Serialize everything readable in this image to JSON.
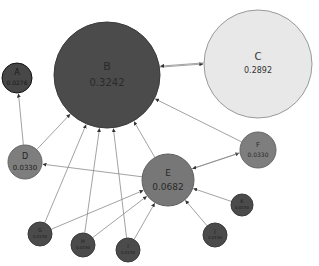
{
  "diagram": {
    "type": "directed-graph",
    "colors": {
      "edge": "#8a8a8a",
      "dark_node": "#4a4a4a",
      "mid_node": "#7e7e7e",
      "light_node": "#e6e6e6"
    },
    "nodes": [
      {
        "id": "A",
        "label": "A",
        "value": "0.0276",
        "cx": 17,
        "cy": 78,
        "r": 15,
        "fill": "#474747",
        "stroke": "#111111",
        "text": "#1a1a1a",
        "fs": 8,
        "vfs": 6
      },
      {
        "id": "B",
        "label": "B",
        "value": "0.3242",
        "cx": 107,
        "cy": 75,
        "r": 53,
        "fill": "#4b4b4b",
        "stroke": "#3a3a3a",
        "text": "#2a2a2a",
        "fs": 11,
        "vfs": 10
      },
      {
        "id": "C",
        "label": "C",
        "value": "0.2892",
        "cx": 258,
        "cy": 64,
        "r": 54,
        "fill": "#e8e8e8",
        "stroke": "#9a9a9a",
        "text": "#333333",
        "fs": 10,
        "vfs": 8
      },
      {
        "id": "D",
        "label": "D",
        "value": "0.0330",
        "cx": 25,
        "cy": 162,
        "r": 17,
        "fill": "#7e7e7e",
        "stroke": "#666666",
        "text": "#222222",
        "fs": 8,
        "vfs": 7
      },
      {
        "id": "E",
        "label": "E",
        "value": "0.0682",
        "cx": 168,
        "cy": 180,
        "r": 26,
        "fill": "#777777",
        "stroke": "#5f5f5f",
        "text": "#2a2a2a",
        "fs": 9,
        "vfs": 9
      },
      {
        "id": "F",
        "label": "F",
        "value": "0.0330",
        "cx": 258,
        "cy": 150,
        "r": 18,
        "fill": "#7e7e7e",
        "stroke": "#666666",
        "text": "#2a2a2a",
        "fs": 7,
        "vfs": 6
      },
      {
        "id": "G",
        "label": "G",
        "value": "0.0150",
        "cx": 40,
        "cy": 234,
        "r": 12,
        "fill": "#4b4b4b",
        "stroke": "#3a3a3a",
        "text": "#1e1e1e",
        "fs": 5,
        "vfs": 4
      },
      {
        "id": "H",
        "label": "H",
        "value": "0.0150",
        "cx": 83,
        "cy": 245,
        "r": 12,
        "fill": "#4b4b4b",
        "stroke": "#3a3a3a",
        "text": "#1e1e1e",
        "fs": 5,
        "vfs": 4
      },
      {
        "id": "I",
        "label": "I",
        "value": "0.0150",
        "cx": 128,
        "cy": 250,
        "r": 12,
        "fill": "#4b4b4b",
        "stroke": "#3a3a3a",
        "text": "#1e1e1e",
        "fs": 5,
        "vfs": 4
      },
      {
        "id": "J",
        "label": "J",
        "value": "0.0150",
        "cx": 215,
        "cy": 235,
        "r": 12,
        "fill": "#4b4b4b",
        "stroke": "#3a3a3a",
        "text": "#1e1e1e",
        "fs": 5,
        "vfs": 4
      },
      {
        "id": "K",
        "label": "K",
        "value": "0.0150",
        "cx": 242,
        "cy": 205,
        "r": 11,
        "fill": "#4b4b4b",
        "stroke": "#3a3a3a",
        "text": "#1e1e1e",
        "fs": 5,
        "vfs": 4
      }
    ],
    "edges": [
      {
        "from": "B",
        "to": "C",
        "offset": -4
      },
      {
        "from": "C",
        "to": "B",
        "offset": 5
      },
      {
        "from": "D",
        "to": "A",
        "offset": 0
      },
      {
        "from": "D",
        "to": "B",
        "offset": 0
      },
      {
        "from": "E",
        "to": "B",
        "offset": 0
      },
      {
        "from": "E",
        "to": "D",
        "offset": 0
      },
      {
        "from": "E",
        "to": "F",
        "offset": -3
      },
      {
        "from": "F",
        "to": "E",
        "offset": 3
      },
      {
        "from": "F",
        "to": "B",
        "offset": 0
      },
      {
        "from": "G",
        "to": "B",
        "offset": 0
      },
      {
        "from": "G",
        "to": "E",
        "offset": 0
      },
      {
        "from": "H",
        "to": "B",
        "offset": 0
      },
      {
        "from": "H",
        "to": "E",
        "offset": 0
      },
      {
        "from": "I",
        "to": "B",
        "offset": 0
      },
      {
        "from": "I",
        "to": "E",
        "offset": 0
      },
      {
        "from": "J",
        "to": "E",
        "offset": 0
      },
      {
        "from": "K",
        "to": "E",
        "offset": 0
      }
    ]
  }
}
